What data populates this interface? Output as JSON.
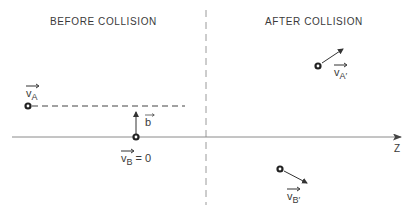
{
  "headings": {
    "before": "BEFORE COLLISION",
    "after": "AFTER COLLISION"
  },
  "axis": {
    "label": "Z"
  },
  "particles": {
    "a_before": {
      "marker": "A"
    },
    "b_before": {
      "marker": "B"
    },
    "a_after": {
      "marker": "A"
    },
    "b_after": {
      "marker": "B"
    }
  },
  "labels": {
    "v_a": {
      "symbol": "v",
      "subscript": "A",
      "suffix": ""
    },
    "b": {
      "symbol": "b"
    },
    "v_b": {
      "symbol": "v",
      "subscript": "B",
      "suffix": " = 0"
    },
    "v_a_prime": {
      "symbol": "v",
      "subscript": "A′",
      "suffix": ""
    },
    "v_b_prime": {
      "symbol": "v",
      "subscript": "B′",
      "suffix": ""
    }
  },
  "colors": {
    "ink": "#333333",
    "axis": "#888888",
    "divider": "#999999"
  }
}
